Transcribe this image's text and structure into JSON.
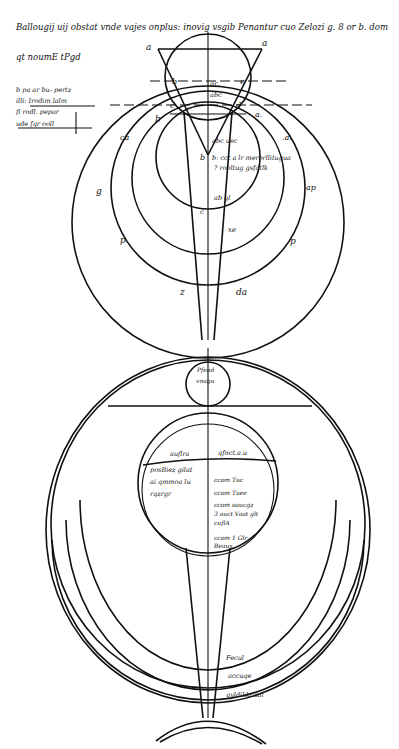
{
  "diagram": {
    "header_text": {
      "line1": "Ballougij uij obstat vnde vajes onplus: inovig vsgib Penantur cuo Zelozi g. 8 or b. dom",
      "line2": "qt noumE tPgd"
    },
    "marginal_notes": [
      "b pa ar bu- pertz",
      "illi: Irodim lalm",
      "fi rodl. pepar",
      "ude fqr ooll"
    ],
    "top_figure": {
      "point_labels": {
        "a_left": "a",
        "a_right": "a",
        "b_left": "b",
        "a_mid": "a.",
        "c_left": "c",
        "d_right": "d",
        "e_right": "e",
        "b_apex": "b",
        "ring_left": "ca",
        "ring_right": ".a.",
        "outer_left": "g",
        "outer_right": "ap",
        "lower_left": "p",
        "lower_right": "p",
        "cone_left": "z",
        "cone_right": "da",
        "center_mark": "ac.",
        "inner_mark": "abc",
        "bottom_inner": "c",
        "mid_note": "xe"
      },
      "inner_notes": [
        "abc uec",
        "b: cct a lr merorllitugua",
        "? rooltug gsfatlk",
        "ab ql"
      ]
    },
    "bottom_figure": {
      "small_circle_text": [
        "Pfead",
        "vnagu"
      ],
      "globe_header_left": "auflra",
      "globe_header_right": "qfnct.a.u",
      "globe_left_text": [
        "posBiez gilat",
        "ai qmmoa lu",
        "rqzrgr"
      ],
      "globe_right_text": [
        "ccom Tuc",
        "ccom Tuee",
        "ccom oaucgz",
        "3 auct Vaat glt",
        "cuflA",
        "ccom 1 Glr",
        "Beaux"
      ],
      "band_labels": [
        "Fecul",
        "accuqe",
        "qyldikkcaal"
      ]
    }
  }
}
